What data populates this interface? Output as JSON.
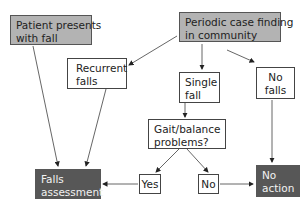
{
  "nodes": {
    "patient": {
      "line1": "Patient presents",
      "line2": "with fall",
      "style": "gray"
    },
    "periodic": {
      "line1": "Periodic case finding",
      "line2": "in community",
      "style": "gray"
    },
    "recurrent": {
      "line1": "Recurrent",
      "line2": "falls",
      "style": "white"
    },
    "single": {
      "line1": "Single",
      "line2": "fall",
      "style": "white"
    },
    "nofalls": {
      "line1": "No",
      "line2": "falls",
      "style": "white"
    },
    "gait": {
      "line1": "Gait/balance",
      "line2": "problems?",
      "style": "white"
    },
    "yes": {
      "label": "Yes",
      "style": "white"
    },
    "no": {
      "label": "No",
      "style": "white"
    },
    "assessment": {
      "line1": "Falls",
      "line2": "assessment",
      "style": "dark"
    },
    "noaction": {
      "line1": "No",
      "line2": "action",
      "style": "dark"
    }
  },
  "edges": [
    {
      "from": "patient",
      "to": "assessment"
    },
    {
      "from": "periodic",
      "to": "recurrent"
    },
    {
      "from": "periodic",
      "to": "single"
    },
    {
      "from": "periodic",
      "to": "nofalls"
    },
    {
      "from": "recurrent",
      "to": "assessment"
    },
    {
      "from": "single",
      "to": "gait"
    },
    {
      "from": "gait",
      "to": "yes"
    },
    {
      "from": "gait",
      "to": "no"
    },
    {
      "from": "yes",
      "to": "assessment"
    },
    {
      "from": "no",
      "to": "noaction"
    },
    {
      "from": "nofalls",
      "to": "noaction"
    }
  ],
  "colors": {
    "gray_fill": "#b3b3b3",
    "dark_fill": "#575757",
    "line": "#444444"
  }
}
